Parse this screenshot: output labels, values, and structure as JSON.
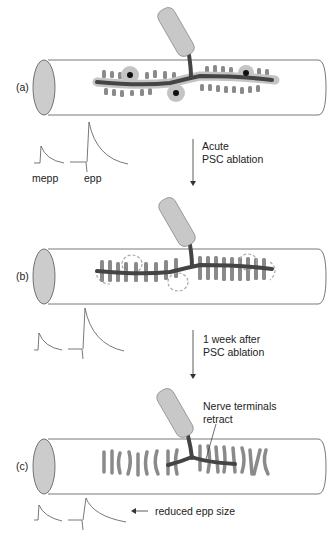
{
  "panels": [
    {
      "label": "(a)"
    },
    {
      "label": "(b)"
    },
    {
      "label": "(c)"
    }
  ],
  "traces": {
    "mepp_label": "mepp",
    "epp_label": "epp"
  },
  "transitions": [
    {
      "line1": "Acute",
      "line2": "PSC ablation"
    },
    {
      "line1": "1 week after",
      "line2": "PSC ablation"
    }
  ],
  "annotations": {
    "retract_line1": "Nerve terminals",
    "retract_line2": "retract",
    "reduced": "reduced epp size"
  },
  "colors": {
    "fiber_outline": "#555555",
    "fiber_end": "#cccccc",
    "axon": "#444444",
    "receptors": "#8a8a8a",
    "schwann": "#bdbdbd",
    "nerve_cylinder": "#c8c8c8"
  }
}
